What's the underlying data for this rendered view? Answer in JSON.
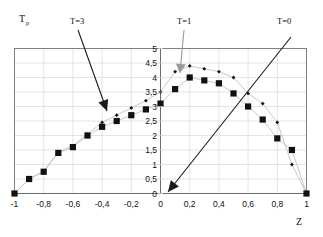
{
  "chart_data": {
    "type": "scatter",
    "title": "",
    "xlabel": "Z",
    "ylabel": "Tp",
    "ylabel_main": "T",
    "ylabel_sub": "p",
    "xlim": [
      -1,
      1
    ],
    "ylim": [
      0,
      5
    ],
    "grid": true,
    "legend": "none",
    "x_tick_labels": [
      "-1",
      "-0,8",
      "-0,6",
      "-0,4",
      "-0,2",
      "0",
      "0,2",
      "0,4",
      "0,6",
      "0,8",
      "1"
    ],
    "x_tick_values": [
      -1,
      -0.8,
      -0.6,
      -0.4,
      -0.2,
      0,
      0.2,
      0.4,
      0.6,
      0.8,
      1
    ],
    "y_tick_labels": [
      "0",
      "0,5",
      "1",
      "1,5",
      "2",
      "2,5",
      "3",
      "3,5",
      "4",
      "4,5",
      "5"
    ],
    "y_tick_values": [
      0,
      0.5,
      1,
      1.5,
      2,
      2.5,
      3,
      3.5,
      4,
      4.5,
      5
    ],
    "x": [
      -1,
      -0.9,
      -0.8,
      -0.7,
      -0.6,
      -0.5,
      -0.4,
      -0.3,
      -0.2,
      -0.1,
      0,
      0.1,
      0.2,
      0.3,
      0.4,
      0.5,
      0.6,
      0.7,
      0.8,
      0.9,
      1
    ],
    "series": [
      {
        "name": "T=3",
        "marker": "square",
        "values": [
          0,
          0.5,
          0.75,
          1.4,
          1.6,
          2.0,
          2.3,
          2.5,
          2.7,
          2.9,
          3.1,
          3.6,
          4.0,
          3.9,
          3.8,
          3.45,
          3.0,
          2.55,
          1.9,
          1.5,
          0
        ]
      },
      {
        "name": "T=1",
        "marker": "diamond",
        "values": [
          0,
          0.5,
          0.78,
          1.43,
          1.65,
          2.05,
          2.45,
          2.7,
          2.95,
          3.2,
          3.5,
          4.2,
          4.4,
          4.3,
          4.2,
          4.0,
          3.45,
          3.1,
          2.45,
          1.0,
          0
        ]
      }
    ],
    "annotations": [
      {
        "label": "T=3",
        "target_x": -0.33,
        "target_y": 2.75
      },
      {
        "label": "T=1",
        "target_x": 0.2,
        "target_y": 4.3
      },
      {
        "label": "T=0",
        "target_x": 0.2,
        "target_y": 0.0
      }
    ]
  },
  "axis": {
    "y_axis_title_main": "T",
    "y_axis_title_sub": "p",
    "x_axis_title": "Z"
  },
  "annotations": {
    "t3": "T=3",
    "t1": "T=1",
    "t0": "T=0"
  },
  "colors": {
    "marker": "#111111",
    "line": "#c9c9c9",
    "grid": "#d9d9d9",
    "frame": "#808080",
    "annotation_dark": "#1a1a1a",
    "annotation_gray": "#9a9a9a",
    "background": "#ffffff"
  }
}
